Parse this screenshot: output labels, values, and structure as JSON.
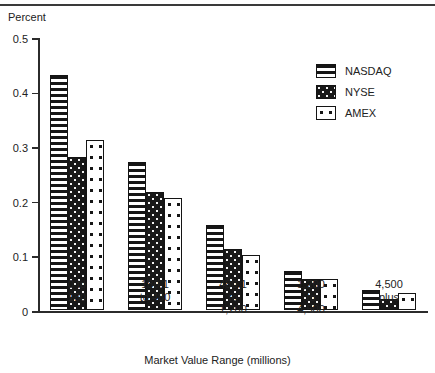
{
  "chart_data": {
    "type": "bar",
    "title": "",
    "xlabel": "Market Value Range (millions)",
    "ylabel": "Percent",
    "ylim": [
      0,
      0.5
    ],
    "yticks": [
      "0",
      "0.1",
      "0.2",
      "0.3",
      "0.4",
      "0.5"
    ],
    "ytick_values": [
      0,
      0.1,
      0.2,
      0.3,
      0.4,
      0.5
    ],
    "grid": false,
    "legend_position": "top-right",
    "categories": [
      "0 to\n180",
      "180.1\nto 480",
      "480.1\nto\n1,200",
      "1,200\nto\n4,500",
      "4,500\nplus"
    ],
    "category_lines": [
      [
        "0 to",
        "180"
      ],
      [
        "180.1",
        "to 480"
      ],
      [
        "480.1",
        "to",
        "1,200"
      ],
      [
        "1,200",
        "to",
        "4,500"
      ],
      [
        "4,500",
        "plus"
      ]
    ],
    "series": [
      {
        "name": "NASDAQ",
        "pattern": "horizontal-stripes",
        "values": [
          0.43,
          0.27,
          0.155,
          0.07,
          0.035
        ]
      },
      {
        "name": "NYSE",
        "pattern": "dark-dotted",
        "values": [
          0.28,
          0.215,
          0.11,
          0.055,
          0.02
        ]
      },
      {
        "name": "AMEX",
        "pattern": "light-dotted",
        "values": [
          0.31,
          0.205,
          0.1,
          0.055,
          0.03
        ]
      }
    ]
  },
  "legend": {
    "entries": [
      {
        "label": "NASDAQ"
      },
      {
        "label": "NYSE"
      },
      {
        "label": "AMEX"
      }
    ]
  },
  "colors": {
    "axis": "#2b2b2b",
    "text": "#222222",
    "bar_outline": "#141414",
    "fill_dark": "#181818",
    "fill_light": "#ffffff"
  }
}
